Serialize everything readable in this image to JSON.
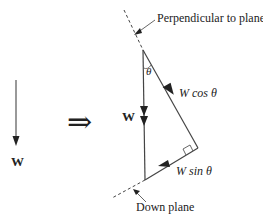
{
  "diagram": {
    "left_vector": {
      "label": "W"
    },
    "implies_symbol": "⇒",
    "triangle": {
      "vertical_label": "W",
      "angle_label": "θ",
      "hypotenuse_label": "W cos θ",
      "bottom_label": "W sin θ"
    },
    "annotations": {
      "top": "Perpendicular  to plane",
      "bottom": "Down plane"
    },
    "colors": {
      "line": "#333333",
      "text": "#222222",
      "background": "#ffffff"
    }
  }
}
